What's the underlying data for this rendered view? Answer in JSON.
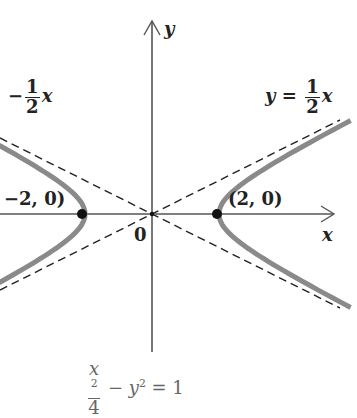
{
  "diagram": {
    "equation": {
      "num_base": "x",
      "num_exp": "2",
      "den": "4",
      "minus": "−",
      "y_base": "y",
      "y_exp": "2",
      "equals": "=",
      "rhs": "1"
    },
    "axes": {
      "x_label": "x",
      "y_label": "y",
      "origin_label": "0"
    },
    "asymptotes": {
      "positive": {
        "lhs": "y",
        "equals": "=",
        "num": "1",
        "den": "2",
        "var": "x",
        "slope": 0.5
      },
      "negative": {
        "lhs": "y",
        "equals": "=",
        "minus": "−",
        "num": "1",
        "den": "2",
        "var": "x",
        "slope": -0.5,
        "visible_text": "−½x"
      }
    },
    "vertices": [
      {
        "label": "(2, 0)",
        "x": 2,
        "y": 0
      },
      {
        "label": "−2, 0)",
        "full_label": "(−2, 0)",
        "x": -2,
        "y": 0
      }
    ],
    "colors": {
      "curve": "#8a8a8a",
      "axis": "#555555",
      "asymptote": "#222222",
      "point": "#111111",
      "equation": "#666666"
    },
    "geometry": {
      "origin_px": [
        152,
        214
      ],
      "unit_x_px": 33.5,
      "unit_y_px": 33.5,
      "a": 2,
      "b": 1
    }
  }
}
